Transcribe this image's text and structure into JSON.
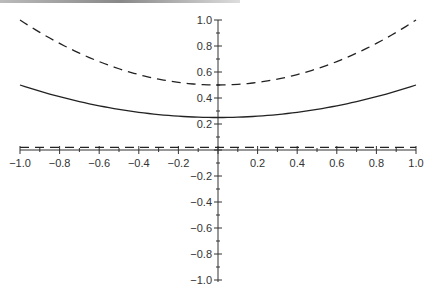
{
  "chart_data": {
    "type": "line",
    "title": "",
    "xlabel": "",
    "ylabel": "",
    "xlim": [
      -1.0,
      1.0
    ],
    "ylim": [
      -1.0,
      1.0
    ],
    "grid": false,
    "legend": null,
    "x_ticks": [
      "-1.0",
      "-0.8",
      "-0.6",
      "-0.4",
      "-0.2",
      "0.2",
      "0.4",
      "0.6",
      "0.8",
      "1.0"
    ],
    "y_ticks": [
      "1.0",
      "0.8",
      "0.6",
      "0.4",
      "0.2",
      "-0.2",
      "-0.4",
      "-0.6",
      "-0.8",
      "-1.0"
    ],
    "series": [
      {
        "name": "dashed upper",
        "style": "dashed",
        "x": [
          -1.0,
          -0.8,
          -0.6,
          -0.4,
          -0.2,
          0.0,
          0.2,
          0.4,
          0.6,
          0.8,
          1.0
        ],
        "y": [
          1.0,
          0.82,
          0.68,
          0.58,
          0.52,
          0.5,
          0.52,
          0.58,
          0.68,
          0.82,
          1.0
        ]
      },
      {
        "name": "solid",
        "style": "solid",
        "x": [
          -1.0,
          -0.8,
          -0.6,
          -0.4,
          -0.2,
          0.0,
          0.2,
          0.4,
          0.6,
          0.8,
          1.0
        ],
        "y": [
          0.5,
          0.41,
          0.34,
          0.29,
          0.26,
          0.25,
          0.26,
          0.29,
          0.34,
          0.41,
          0.5
        ]
      },
      {
        "name": "dashed near zero",
        "style": "dashed",
        "x": [
          -1.0,
          1.0
        ],
        "y": [
          0.02,
          0.02
        ]
      }
    ]
  }
}
